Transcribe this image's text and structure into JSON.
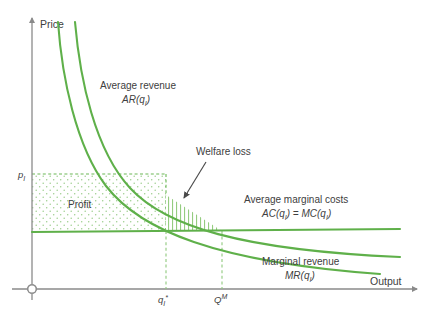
{
  "figure": {
    "axes": {
      "y_label": "Price",
      "x_label": "Output",
      "origin_marker": "origin-circle"
    },
    "ticks": {
      "y": [
        {
          "id": "p_I",
          "base": "p",
          "sub": "I",
          "value_px": 174
        }
      ],
      "x": [
        {
          "id": "q_I_star",
          "base": "q",
          "sub": "I",
          "sup": "*",
          "value_px": 166
        },
        {
          "id": "Q_M",
          "base": "Q",
          "sup": "M",
          "value_px": 222
        }
      ]
    },
    "curves": [
      {
        "name": "average-revenue",
        "label_line1": "Average revenue",
        "label_line2_base": "AR(q",
        "label_line2_sub": "I",
        "label_line2_tail": ")",
        "color": "#5fb04a"
      },
      {
        "name": "marginal-revenue",
        "label_line1": "Marginal revenue",
        "label_line2_base": "MR(q",
        "label_line2_sub": "I",
        "label_line2_tail": ")",
        "color": "#5fb04a"
      },
      {
        "name": "average-marginal-cost",
        "label_line1": "Average marginal costs",
        "label_line2_base": "AC(q",
        "label_line2_sub": "I",
        "label_line2_mid": ") = MC(q",
        "label_line2_sub2": "I",
        "label_line2_tail": ")",
        "color": "#5fb04a"
      }
    ],
    "regions": [
      {
        "name": "profit-area",
        "label": "Profit",
        "fill_pattern": "stipple-dots",
        "border": "dashed-green",
        "color": "#5fb04a"
      },
      {
        "name": "welfare-loss-area",
        "label": "Welfare loss",
        "fill_pattern": "vertical-hatch",
        "color": "#5fb04a"
      }
    ],
    "colors": {
      "curve_green": "#5fb04a",
      "axis_gray": "#8a8a8a",
      "text_gray": "#404040",
      "background": "#ffffff"
    }
  }
}
